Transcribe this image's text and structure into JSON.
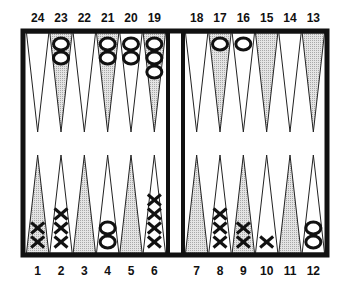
{
  "game": "Backgammon",
  "colors": {
    "board_border": "#111111",
    "point_light": "#ffffff",
    "point_dark": "#c8c8c8",
    "checker_stroke": "#111111"
  },
  "top_labels": [
    "24",
    "23",
    "22",
    "21",
    "20",
    "19",
    "18",
    "17",
    "16",
    "15",
    "14",
    "13"
  ],
  "bottom_labels": [
    "1",
    "2",
    "3",
    "4",
    "5",
    "6",
    "7",
    "8",
    "9",
    "10",
    "11",
    "12"
  ],
  "points": [
    {
      "num": 1,
      "shade": "dark",
      "player": "X",
      "count": 2
    },
    {
      "num": 2,
      "shade": "light",
      "player": "X",
      "count": 3
    },
    {
      "num": 3,
      "shade": "dark",
      "player": "",
      "count": 0
    },
    {
      "num": 4,
      "shade": "light",
      "player": "O",
      "count": 2
    },
    {
      "num": 5,
      "shade": "dark",
      "player": "",
      "count": 0
    },
    {
      "num": 6,
      "shade": "light",
      "player": "X",
      "count": 4
    },
    {
      "num": 7,
      "shade": "dark",
      "player": "",
      "count": 0
    },
    {
      "num": 8,
      "shade": "light",
      "player": "X",
      "count": 3
    },
    {
      "num": 9,
      "shade": "dark",
      "player": "X",
      "count": 2
    },
    {
      "num": 10,
      "shade": "light",
      "player": "X",
      "count": 1
    },
    {
      "num": 11,
      "shade": "dark",
      "player": "",
      "count": 0
    },
    {
      "num": 12,
      "shade": "light",
      "player": "O",
      "count": 2
    },
    {
      "num": 13,
      "shade": "dark",
      "player": "",
      "count": 0
    },
    {
      "num": 14,
      "shade": "light",
      "player": "",
      "count": 0
    },
    {
      "num": 15,
      "shade": "dark",
      "player": "",
      "count": 0
    },
    {
      "num": 16,
      "shade": "light",
      "player": "O",
      "count": 1
    },
    {
      "num": 17,
      "shade": "dark",
      "player": "O",
      "count": 1
    },
    {
      "num": 18,
      "shade": "light",
      "player": "",
      "count": 0
    },
    {
      "num": 19,
      "shade": "dark",
      "player": "O",
      "count": 3
    },
    {
      "num": 20,
      "shade": "light",
      "player": "O",
      "count": 2
    },
    {
      "num": 21,
      "shade": "dark",
      "player": "O",
      "count": 2
    },
    {
      "num": 22,
      "shade": "light",
      "player": "",
      "count": 0
    },
    {
      "num": 23,
      "shade": "dark",
      "player": "O",
      "count": 2
    },
    {
      "num": 24,
      "shade": "light",
      "player": "",
      "count": 0
    }
  ]
}
